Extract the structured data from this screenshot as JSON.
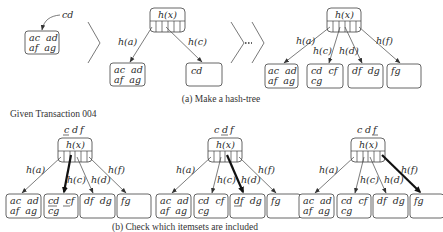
{
  "part_a": {
    "caption": "(a) Make a hash-tree",
    "step1": {
      "incoming_label": "cd",
      "leaf": {
        "line1": "ac  ad",
        "line2": "af  ag"
      }
    },
    "step2": {
      "node_label": "h(x)",
      "edges": [
        "h(a)",
        "h(c)"
      ],
      "leaves": [
        {
          "line1": "ac  ad",
          "line2": "af  ag"
        },
        {
          "line1": "cd",
          "line2": ""
        }
      ]
    },
    "step3": {
      "node_label": "h(x)",
      "edges": [
        "h(a)",
        "h(c)",
        "h(d)",
        "h(f)"
      ],
      "leaves": [
        {
          "line1": "ac  ad",
          "line2": "af  ag"
        },
        {
          "line1": "cd  cf",
          "line2": "cg"
        },
        {
          "line1": "df  dg",
          "line2": ""
        },
        {
          "line1": "fg",
          "line2": ""
        }
      ]
    }
  },
  "part_b": {
    "title": "Given Transaction 004",
    "caption": "(b) Check which itemsets are included",
    "trees": [
      {
        "transaction_items": [
          "c",
          "d",
          "f"
        ],
        "underlined_item": "c",
        "node_label": "h(x)",
        "edges": [
          "h(a)",
          "h(c)",
          "h(d)",
          "h(f)"
        ],
        "highlighted_edge": "h(c)",
        "leaves": [
          {
            "line1": "ac  ad",
            "line2": "af  ag"
          },
          {
            "line1": "cd  cf",
            "line2": "cg"
          },
          {
            "line1": "df  dg",
            "line2": ""
          },
          {
            "line1": "fg",
            "line2": ""
          }
        ]
      },
      {
        "transaction_items": [
          "c",
          "d",
          "f"
        ],
        "underlined_item": "d",
        "node_label": "h(x)",
        "edges": [
          "h(a)",
          "h(c)",
          "h(d)",
          "h(f)"
        ],
        "highlighted_edge": "h(d)",
        "leaves": [
          {
            "line1": "ac  ad",
            "line2": "af  ag"
          },
          {
            "line1": "cd  cf",
            "line2": "cg"
          },
          {
            "line1": "df  dg",
            "line2": ""
          },
          {
            "line1": "fg",
            "line2": ""
          }
        ]
      },
      {
        "transaction_items": [
          "c",
          "d",
          "f"
        ],
        "underlined_item": "f",
        "node_label": "h(x)",
        "edges": [
          "h(a)",
          "h(c)",
          "h(d)",
          "h(f)"
        ],
        "highlighted_edge": "h(f)",
        "leaves": [
          {
            "line1": "ac  ad",
            "line2": "af  ag"
          },
          {
            "line1": "cd  cf",
            "line2": "cg"
          },
          {
            "line1": "df  dg",
            "line2": ""
          },
          {
            "line1": "fg",
            "line2": ""
          }
        ]
      }
    ]
  }
}
